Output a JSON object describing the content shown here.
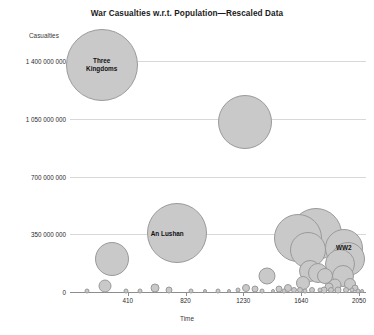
{
  "chart_data": {
    "type": "scatter",
    "title": "War Casualties w.r.t. Population—Rescaled Data",
    "xlabel": "Time",
    "ylabel": "Casualties",
    "grid": true,
    "legend": "none",
    "xlim": [
      0,
      2100
    ],
    "ylim": [
      0,
      1500000000
    ],
    "xticks": [
      "410",
      "820",
      "1230",
      "1640",
      "2050"
    ],
    "xtick_values": [
      410,
      820,
      1230,
      1640,
      2050
    ],
    "yticks": [
      "0",
      "350 000 000",
      "700 000 000",
      "1 050 000 000",
      "1 400 000 000"
    ],
    "ytick_values": [
      0,
      350000000,
      700000000,
      1050000000,
      1400000000
    ],
    "bubble_fill": "#c9c9c9",
    "bubble_stroke": "#9a9a9a",
    "gridline_color": "#d8d8d8",
    "axis_color": "#8d8d8d",
    "annotations": [
      {
        "text": "Three Kingdoms",
        "x": 225,
        "y": 1380000000
      },
      {
        "text": "An Lushan",
        "x": 690,
        "y": 350000000
      },
      {
        "text": "WW2",
        "x": 1943,
        "y": 265000000
      }
    ],
    "points": [
      {
        "label": "Three Kingdoms",
        "x": 225,
        "y": 1380000000,
        "size": 72
      },
      {
        "label": "",
        "x": 1245,
        "y": 1030000000,
        "size": 54
      },
      {
        "label": "An Lushan",
        "x": 760,
        "y": 360000000,
        "size": 60
      },
      {
        "label": "",
        "x": 1615,
        "y": 330000000,
        "size": 48
      },
      {
        "label": "",
        "x": 1745,
        "y": 350000000,
        "size": 52
      },
      {
        "label": "",
        "x": 1685,
        "y": 255000000,
        "size": 36
      },
      {
        "label": "WW2",
        "x": 1943,
        "y": 265000000,
        "size": 38
      },
      {
        "label": "",
        "x": 1975,
        "y": 200000000,
        "size": 34
      },
      {
        "label": "",
        "x": 1915,
        "y": 170000000,
        "size": 30
      },
      {
        "label": "",
        "x": 300,
        "y": 200000000,
        "size": 34
      },
      {
        "label": "",
        "x": 1700,
        "y": 130000000,
        "size": 22
      },
      {
        "label": "",
        "x": 1760,
        "y": 115000000,
        "size": 20
      },
      {
        "label": "",
        "x": 1810,
        "y": 95000000,
        "size": 16
      },
      {
        "label": "",
        "x": 1400,
        "y": 100000000,
        "size": 17
      },
      {
        "label": "",
        "x": 1935,
        "y": 95000000,
        "size": 22
      },
      {
        "label": "",
        "x": 250,
        "y": 35000000,
        "size": 13
      },
      {
        "label": "",
        "x": 1650,
        "y": 55000000,
        "size": 14
      },
      {
        "label": "",
        "x": 1880,
        "y": 45000000,
        "size": 13
      },
      {
        "label": "",
        "x": 1990,
        "y": 50000000,
        "size": 12
      },
      {
        "label": "",
        "x": 600,
        "y": 25000000,
        "size": 9
      },
      {
        "label": "",
        "x": 700,
        "y": 15000000,
        "size": 7
      },
      {
        "label": "",
        "x": 1250,
        "y": 22000000,
        "size": 8
      },
      {
        "label": "",
        "x": 1310,
        "y": 18000000,
        "size": 7
      },
      {
        "label": "",
        "x": 1480,
        "y": 20000000,
        "size": 7
      },
      {
        "label": "",
        "x": 1550,
        "y": 24000000,
        "size": 8
      },
      {
        "label": "",
        "x": 1590,
        "y": 15000000,
        "size": 6
      },
      {
        "label": "",
        "x": 1840,
        "y": 30000000,
        "size": 9
      },
      {
        "label": "",
        "x": 2020,
        "y": 22000000,
        "size": 7
      },
      {
        "label": "",
        "x": 120,
        "y": 8000000,
        "size": 5
      },
      {
        "label": "",
        "x": 400,
        "y": 7000000,
        "size": 5
      },
      {
        "label": "",
        "x": 500,
        "y": 9000000,
        "size": 5
      },
      {
        "label": "",
        "x": 860,
        "y": 8000000,
        "size": 5
      },
      {
        "label": "",
        "x": 960,
        "y": 7000000,
        "size": 4
      },
      {
        "label": "",
        "x": 1050,
        "y": 9000000,
        "size": 5
      },
      {
        "label": "",
        "x": 1130,
        "y": 7000000,
        "size": 4
      },
      {
        "label": "",
        "x": 1190,
        "y": 10000000,
        "size": 5
      },
      {
        "label": "",
        "x": 1360,
        "y": 8000000,
        "size": 5
      },
      {
        "label": "",
        "x": 1440,
        "y": 7000000,
        "size": 4
      },
      {
        "label": "",
        "x": 1520,
        "y": 9000000,
        "size": 5
      },
      {
        "label": "",
        "x": 1630,
        "y": 11000000,
        "size": 6
      },
      {
        "label": "",
        "x": 1670,
        "y": 9000000,
        "size": 5
      },
      {
        "label": "",
        "x": 1715,
        "y": 12000000,
        "size": 6
      },
      {
        "label": "",
        "x": 1775,
        "y": 10000000,
        "size": 5
      },
      {
        "label": "",
        "x": 1800,
        "y": 14000000,
        "size": 7
      },
      {
        "label": "",
        "x": 1855,
        "y": 11000000,
        "size": 6
      },
      {
        "label": "",
        "x": 1900,
        "y": 13000000,
        "size": 7
      },
      {
        "label": "",
        "x": 1955,
        "y": 12000000,
        "size": 6
      },
      {
        "label": "",
        "x": 2000,
        "y": 10000000,
        "size": 5
      },
      {
        "label": "",
        "x": 2045,
        "y": 9000000,
        "size": 5
      },
      {
        "label": "",
        "x": 2075,
        "y": 7000000,
        "size": 4
      }
    ]
  }
}
